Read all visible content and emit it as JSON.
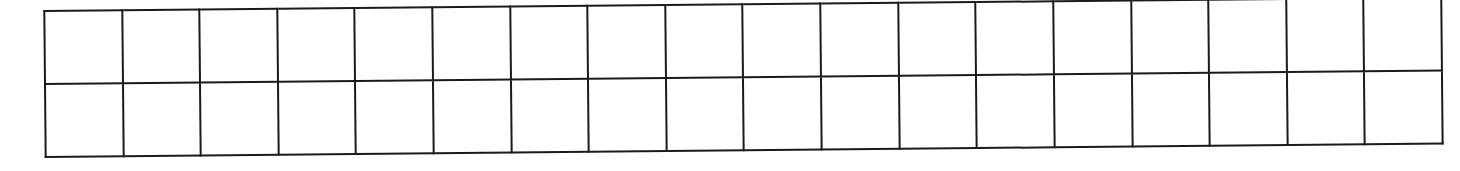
{
  "grid": {
    "rows": 2,
    "columns": 18,
    "line_color": "#1a1a1a",
    "background": "#ffffff",
    "cells": [
      [
        "",
        "",
        "",
        "",
        "",
        "",
        "",
        "",
        "",
        "",
        "",
        "",
        "",
        "",
        "",
        "",
        "",
        ""
      ],
      [
        "",
        "",
        "",
        "",
        "",
        "",
        "",
        "",
        "",
        "",
        "",
        "",
        "",
        "",
        "",
        "",
        "",
        ""
      ]
    ]
  }
}
